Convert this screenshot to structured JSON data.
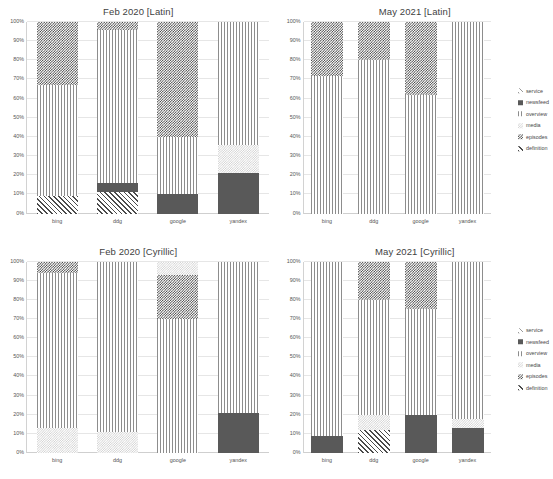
{
  "figure": {
    "y_axis": {
      "ticks": [
        "0%",
        "10%",
        "20%",
        "30%",
        "40%",
        "50%",
        "60%",
        "70%",
        "80%",
        "90%",
        "100%"
      ]
    },
    "categories": [
      "bing",
      "ddg",
      "google",
      "yandex"
    ],
    "legend": {
      "items": [
        {
          "label": "service",
          "pattern": "service"
        },
        {
          "label": "newsfeed",
          "pattern": "newsfeed"
        },
        {
          "label": "overview",
          "pattern": "overview"
        },
        {
          "label": "media",
          "pattern": "media"
        },
        {
          "label": "episodes",
          "pattern": "episodes"
        },
        {
          "label": "definition",
          "pattern": "definition"
        }
      ]
    },
    "panels": [
      {
        "title": "Feb 2020 [Latin]"
      },
      {
        "title": "May 2021 [Latin]"
      },
      {
        "title": "Feb 2020 [Cyrillic]"
      },
      {
        "title": "May 2021 [Cyrillic]"
      }
    ]
  },
  "chart_data": [
    {
      "type": "bar",
      "title": "Feb 2020 [Latin]",
      "stacked": "100%",
      "xlabel": "",
      "ylabel": "",
      "ylim": [
        0,
        100
      ],
      "grid": true,
      "legend_position": "right",
      "categories": [
        "bing",
        "ddg",
        "google",
        "yandex"
      ],
      "series": [
        {
          "name": "definition",
          "values": [
            9,
            11,
            0,
            0
          ]
        },
        {
          "name": "episodes",
          "values": [
            0,
            5,
            10,
            21
          ]
        },
        {
          "name": "media",
          "values": [
            0,
            0,
            0,
            15
          ]
        },
        {
          "name": "overview",
          "values": [
            58,
            80,
            30,
            64
          ]
        },
        {
          "name": "newsfeed",
          "values": [
            0,
            0,
            0,
            0
          ]
        },
        {
          "name": "service",
          "values": [
            0,
            0,
            0,
            0
          ]
        },
        {
          "name": "episodes_top",
          "values": [
            33,
            4,
            60,
            0
          ]
        }
      ]
    },
    {
      "type": "bar",
      "title": "May 2021 [Latin]",
      "stacked": "100%",
      "xlabel": "",
      "ylabel": "",
      "ylim": [
        0,
        100
      ],
      "grid": true,
      "legend_position": "right",
      "categories": [
        "bing",
        "ddg",
        "google",
        "yandex"
      ],
      "series": [
        {
          "name": "definition",
          "values": [
            0,
            0,
            0,
            0
          ]
        },
        {
          "name": "episodes",
          "values": [
            0,
            0,
            0,
            0
          ]
        },
        {
          "name": "media",
          "values": [
            0,
            0,
            0,
            0
          ]
        },
        {
          "name": "overview",
          "values": [
            72,
            80,
            62,
            100
          ]
        },
        {
          "name": "newsfeed",
          "values": [
            0,
            0,
            0,
            0
          ]
        },
        {
          "name": "service",
          "values": [
            0,
            0,
            0,
            0
          ]
        },
        {
          "name": "episodes_top",
          "values": [
            28,
            20,
            38,
            0
          ]
        }
      ]
    },
    {
      "type": "bar",
      "title": "Feb 2020 [Cyrillic]",
      "stacked": "100%",
      "xlabel": "",
      "ylabel": "",
      "ylim": [
        0,
        100
      ],
      "grid": true,
      "legend_position": "right",
      "categories": [
        "bing",
        "ddg",
        "google",
        "yandex"
      ],
      "series": [
        {
          "name": "definition",
          "values": [
            0,
            0,
            0,
            0
          ]
        },
        {
          "name": "episodes",
          "values": [
            0,
            0,
            0,
            21
          ]
        },
        {
          "name": "media",
          "values": [
            13,
            11,
            0,
            0
          ]
        },
        {
          "name": "overview",
          "values": [
            81,
            89,
            70,
            79
          ]
        },
        {
          "name": "newsfeed",
          "values": [
            0,
            0,
            0,
            0
          ]
        },
        {
          "name": "service",
          "values": [
            0,
            0,
            0,
            0
          ]
        },
        {
          "name": "episodes_top",
          "values": [
            6,
            0,
            23,
            0
          ]
        },
        {
          "name": "media_top",
          "values": [
            0,
            0,
            7,
            0
          ]
        }
      ]
    },
    {
      "type": "bar",
      "title": "May 2021 [Cyrillic]",
      "stacked": "100%",
      "xlabel": "",
      "ylabel": "",
      "ylim": [
        0,
        100
      ],
      "grid": true,
      "legend_position": "right",
      "categories": [
        "bing",
        "ddg",
        "google",
        "yandex"
      ],
      "series": [
        {
          "name": "definition",
          "values": [
            0,
            12,
            0,
            0
          ]
        },
        {
          "name": "episodes",
          "values": [
            9,
            0,
            20,
            13
          ]
        },
        {
          "name": "media",
          "values": [
            0,
            8,
            0,
            5
          ]
        },
        {
          "name": "overview",
          "values": [
            91,
            60,
            55,
            82
          ]
        },
        {
          "name": "newsfeed",
          "values": [
            0,
            0,
            0,
            0
          ]
        },
        {
          "name": "service",
          "values": [
            0,
            0,
            0,
            0
          ]
        },
        {
          "name": "episodes_top",
          "values": [
            0,
            20,
            25,
            0
          ]
        }
      ]
    }
  ],
  "render": {
    "panels": [
      {
        "title": "Feb 2020 [Latin]",
        "has_legend": false,
        "bars": [
          {
            "cat": "bing",
            "segs": [
              {
                "p": "definition",
                "v": 9
              },
              {
                "p": "overview",
                "v": 58
              },
              {
                "p": "episodes",
                "v": 33
              }
            ]
          },
          {
            "cat": "ddg",
            "segs": [
              {
                "p": "definition",
                "v": 11
              },
              {
                "p": "newsfeed",
                "v": 5
              },
              {
                "p": "overview",
                "v": 80
              },
              {
                "p": "episodes",
                "v": 4
              }
            ]
          },
          {
            "cat": "google",
            "segs": [
              {
                "p": "newsfeed",
                "v": 10
              },
              {
                "p": "overview",
                "v": 30
              },
              {
                "p": "episodes",
                "v": 60
              }
            ]
          },
          {
            "cat": "yandex",
            "segs": [
              {
                "p": "newsfeed",
                "v": 21
              },
              {
                "p": "media",
                "v": 15
              },
              {
                "p": "overview",
                "v": 64
              }
            ]
          }
        ]
      },
      {
        "title": "May 2021 [Latin]",
        "has_legend": true,
        "bars": [
          {
            "cat": "bing",
            "segs": [
              {
                "p": "overview",
                "v": 72
              },
              {
                "p": "episodes",
                "v": 28
              }
            ]
          },
          {
            "cat": "ddg",
            "segs": [
              {
                "p": "overview",
                "v": 80
              },
              {
                "p": "episodes",
                "v": 20
              }
            ]
          },
          {
            "cat": "google",
            "segs": [
              {
                "p": "overview",
                "v": 62
              },
              {
                "p": "episodes",
                "v": 38
              }
            ]
          },
          {
            "cat": "yandex",
            "segs": [
              {
                "p": "overview",
                "v": 100
              }
            ]
          }
        ]
      },
      {
        "title": "Feb 2020 [Cyrillic]",
        "has_legend": false,
        "bars": [
          {
            "cat": "bing",
            "segs": [
              {
                "p": "media",
                "v": 13
              },
              {
                "p": "overview",
                "v": 81
              },
              {
                "p": "episodes",
                "v": 6
              }
            ]
          },
          {
            "cat": "ddg",
            "segs": [
              {
                "p": "media",
                "v": 11
              },
              {
                "p": "overview",
                "v": 89
              }
            ]
          },
          {
            "cat": "google",
            "segs": [
              {
                "p": "overview",
                "v": 70
              },
              {
                "p": "episodes",
                "v": 23
              },
              {
                "p": "media",
                "v": 7
              }
            ]
          },
          {
            "cat": "yandex",
            "segs": [
              {
                "p": "newsfeed",
                "v": 21
              },
              {
                "p": "overview",
                "v": 79
              }
            ]
          }
        ]
      },
      {
        "title": "May 2021 [Cyrillic]",
        "has_legend": true,
        "bars": [
          {
            "cat": "bing",
            "segs": [
              {
                "p": "newsfeed",
                "v": 9
              },
              {
                "p": "overview",
                "v": 91
              }
            ]
          },
          {
            "cat": "ddg",
            "segs": [
              {
                "p": "definition",
                "v": 12
              },
              {
                "p": "media",
                "v": 8
              },
              {
                "p": "overview",
                "v": 60
              },
              {
                "p": "episodes",
                "v": 20
              }
            ]
          },
          {
            "cat": "google",
            "segs": [
              {
                "p": "newsfeed",
                "v": 20
              },
              {
                "p": "overview",
                "v": 55
              },
              {
                "p": "episodes",
                "v": 25
              }
            ]
          },
          {
            "cat": "yandex",
            "segs": [
              {
                "p": "newsfeed",
                "v": 13
              },
              {
                "p": "media",
                "v": 5
              },
              {
                "p": "overview",
                "v": 82
              }
            ]
          }
        ]
      }
    ]
  }
}
